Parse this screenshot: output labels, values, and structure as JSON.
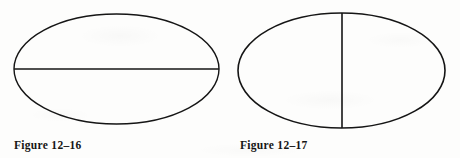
{
  "page": {
    "background_color": "#fdfdfc",
    "ink_color": "#151515",
    "width": 460,
    "height": 158
  },
  "figures": [
    {
      "id": "figure-12-16",
      "caption": "Figure 12–16",
      "shape": "ellipse",
      "axis_line": "horizontal",
      "axis_name": "major-axis",
      "ellipse": {
        "cx": 116.5,
        "cy": 69,
        "rx": 102.5,
        "ry": 55
      },
      "line": {
        "x1": 14,
        "y1": 69,
        "x2": 219,
        "y2": 69
      },
      "stroke_color": "#151515",
      "stroke_width": 1.4
    },
    {
      "id": "figure-12-17",
      "caption": "Figure 12–17",
      "shape": "ellipse",
      "axis_line": "vertical",
      "axis_name": "minor-axis",
      "ellipse": {
        "cx": 111.5,
        "cy": 70.5,
        "rx": 103.5,
        "ry": 57.5
      },
      "line": {
        "x1": 112,
        "y1": 13,
        "x2": 112,
        "y2": 128
      },
      "stroke_color": "#151515",
      "stroke_width": 1.6
    }
  ]
}
